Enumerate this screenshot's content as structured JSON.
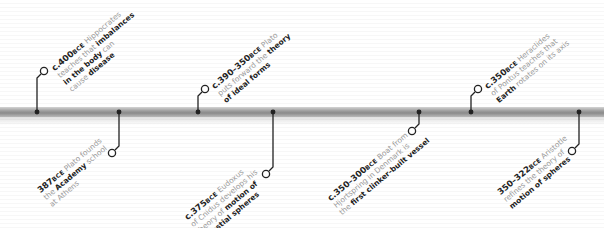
{
  "timeline": {
    "colors": {
      "stem": "#222222",
      "text_muted": "#9a9a9a",
      "text_bold": "#222222",
      "bar": "#8a8a8a"
    },
    "events": [
      {
        "id": "hippocrates",
        "position": "above",
        "date": "c.400",
        "era": "BCE",
        "lines": [
          [
            {
              "t": "Hippocrates",
              "b": false
            }
          ],
          [
            {
              "t": "teaches that ",
              "b": false
            },
            {
              "t": "imbalances",
              "b": true
            }
          ],
          [
            {
              "t": "in the body",
              "b": true
            },
            {
              "t": " can",
              "b": false
            }
          ],
          [
            {
              "t": "cause ",
              "b": false
            },
            {
              "t": "disease",
              "b": true
            }
          ]
        ]
      },
      {
        "id": "plato-academy",
        "position": "below",
        "date": "387",
        "era": "BCE",
        "lines": [
          [
            {
              "t": "Plato founds",
              "b": false
            }
          ],
          [
            {
              "t": "the ",
              "b": false
            },
            {
              "t": "Academy",
              "b": true
            },
            {
              "t": " school",
              "b": false
            }
          ],
          [
            {
              "t": "at Athens",
              "b": false
            }
          ]
        ]
      },
      {
        "id": "plato-forms",
        "position": "above",
        "date": "c.390–350",
        "era": "BCE",
        "lines": [
          [
            {
              "t": "Plato",
              "b": false
            }
          ],
          [
            {
              "t": "puts forward the ",
              "b": false
            },
            {
              "t": "theory",
              "b": true
            }
          ],
          [
            {
              "t": "of ideal forms",
              "b": true
            }
          ]
        ]
      },
      {
        "id": "eudoxus",
        "position": "below",
        "date": "c.375",
        "era": "BCE",
        "lines": [
          [
            {
              "t": "Eudoxus",
              "b": false
            }
          ],
          [
            {
              "t": "of Cnidus develops his",
              "b": false
            }
          ],
          [
            {
              "t": "theory of ",
              "b": false
            },
            {
              "t": "motion of",
              "b": true
            }
          ],
          [
            {
              "t": "celestial spheres",
              "b": true
            }
          ]
        ]
      },
      {
        "id": "hjortspring",
        "position": "below",
        "date": "c.350–300",
        "era": "BCE",
        "lines": [
          [
            {
              "t": "Boat from",
              "b": false
            }
          ],
          [
            {
              "t": "Hjortspring in Denmark is",
              "b": false
            }
          ],
          [
            {
              "t": "the ",
              "b": false
            },
            {
              "t": "first clinker-built vessel",
              "b": true
            }
          ]
        ]
      },
      {
        "id": "heraclides",
        "position": "above",
        "date": "c.350",
        "era": "BCE",
        "lines": [
          [
            {
              "t": "Heraclides",
              "b": false
            }
          ],
          [
            {
              "t": "of Pontus teaches that",
              "b": false
            }
          ],
          [
            {
              "t": "Earth",
              "b": true
            },
            {
              "t": " rotates on its axis",
              "b": false
            }
          ]
        ]
      },
      {
        "id": "aristotle",
        "position": "below",
        "date": "350–322",
        "era": "BCE",
        "lines": [
          [
            {
              "t": "Aristotle",
              "b": false
            }
          ],
          [
            {
              "t": "refines the theory of",
              "b": false
            }
          ],
          [
            {
              "t": "motion of spheres",
              "b": true
            }
          ]
        ]
      }
    ]
  }
}
